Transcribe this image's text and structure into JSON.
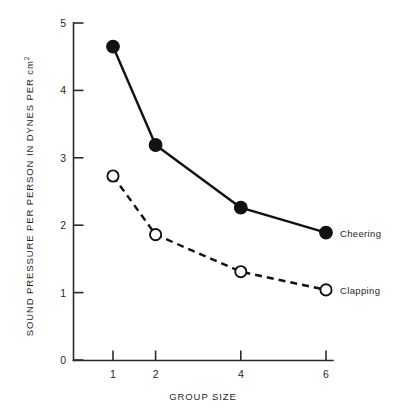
{
  "chart_data": {
    "type": "line",
    "title": "",
    "xlabel": "GROUP SIZE",
    "ylabel": "SOUND PRESSURE PER PERSON IN DYNES PER cm",
    "ylabel_sup": "2",
    "x": [
      1,
      2,
      4,
      6
    ],
    "xtick_labels": [
      "1",
      "2",
      "4",
      "6"
    ],
    "ytick_labels": [
      "0",
      "1",
      "2",
      "3",
      "4",
      "5"
    ],
    "yticks": [
      0,
      1,
      2,
      3,
      4,
      5
    ],
    "xlim": [
      0,
      6.8
    ],
    "ylim": [
      0,
      5
    ],
    "grid": false,
    "legend_position": "inline-right",
    "series": [
      {
        "name": "Cheering",
        "label": "Cheering",
        "values": [
          4.65,
          3.19,
          2.26,
          1.89
        ],
        "line_style": "solid",
        "marker": "filled-circle",
        "color": "#111111"
      },
      {
        "name": "Clapping",
        "label": "Clapping",
        "values": [
          2.73,
          1.86,
          1.31,
          1.04
        ],
        "line_style": "dashed",
        "marker": "open-circle",
        "color": "#111111"
      }
    ]
  },
  "colors": {
    "ink": "#111111",
    "axis": "#2b2b2b",
    "background": "#ffffff"
  }
}
